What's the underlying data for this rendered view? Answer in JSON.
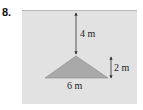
{
  "problem": {
    "number": "8."
  },
  "figure": {
    "depth_label": "4 m",
    "height_label": "2 m",
    "base_label": "6 m",
    "colors": {
      "water": "#e2e2e2",
      "surface_line": "#b8b8b8",
      "triangle_fill": "#a9a9a9",
      "triangle_stroke": "#8a8a8a",
      "arrow": "#333333",
      "text": "#222222"
    }
  }
}
